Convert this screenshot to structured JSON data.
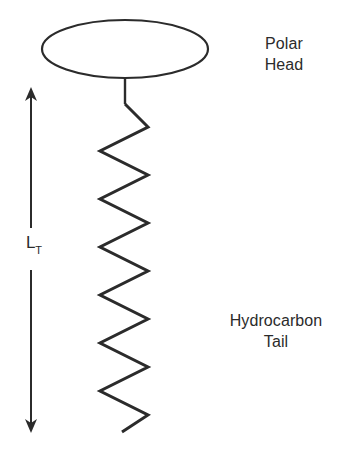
{
  "figure": {
    "background_color": "#ffffff",
    "stroke_color": "#2b2b2b",
    "text_color": "#2b2b2b"
  },
  "labels": {
    "polar_head": {
      "line1": "Polar",
      "line2": "Head"
    },
    "hydrocarbon_tail": {
      "line1": "Hydrocarbon",
      "line2": "Tail"
    },
    "tail_length": {
      "symbol": "L",
      "subscript": "T",
      "full": "LT"
    }
  },
  "shapes": {
    "polar_head_ellipse": {
      "name": "ellipse",
      "cx": 125,
      "cy": 49,
      "rx": 83,
      "ry": 29,
      "filled": false,
      "stroke_width": 2.2
    },
    "stem": {
      "name": "vertical-stem",
      "x": 125,
      "y_top": 78,
      "y_bottom": 104
    },
    "zigzag_tail": {
      "name": "zigzag",
      "left_x": 100,
      "right_x": 148,
      "y_start": 104,
      "y_end": 432,
      "segments": 14,
      "stroke_width": 3
    },
    "dimension_arrow": {
      "name": "double-headed-arrow",
      "x": 31,
      "y_top": 88,
      "y_bottom": 432,
      "gap_top": 228,
      "gap_bottom": 268,
      "stroke_width": 2,
      "arrowhead_size": 9
    }
  }
}
